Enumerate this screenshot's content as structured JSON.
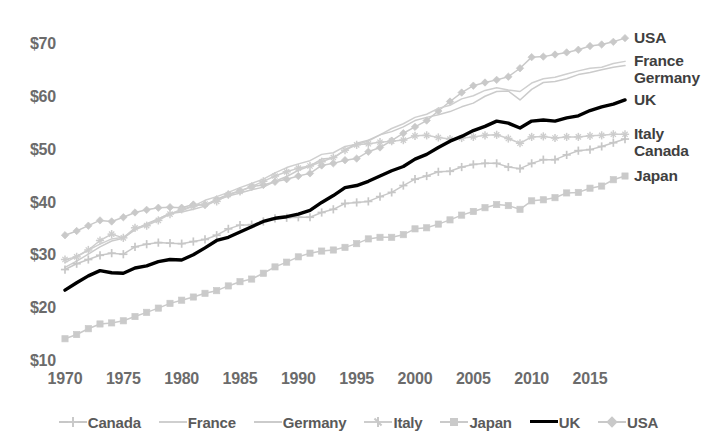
{
  "chart_data": {
    "type": "line",
    "title": "",
    "subtitle": "",
    "xlabel": "",
    "ylabel": "",
    "xlim": [
      1970,
      2019
    ],
    "ylim": [
      10,
      72
    ],
    "grid": false,
    "legend_position": "bottom",
    "y_tick_labels": [
      "$70",
      "$60",
      "$50",
      "$40",
      "$30",
      "$20",
      "$10"
    ],
    "y_tick_values": [
      70,
      60,
      50,
      40,
      30,
      20,
      10
    ],
    "x_tick_labels": [
      "1970",
      "1975",
      "1980",
      "1985",
      "1990",
      "1995",
      "2000",
      "2005",
      "2010",
      "2015"
    ],
    "x_tick_values": [
      1970,
      1975,
      1980,
      1985,
      1990,
      1995,
      2000,
      2005,
      2010,
      2015
    ],
    "x": [
      1970,
      1971,
      1972,
      1973,
      1974,
      1975,
      1976,
      1977,
      1978,
      1979,
      1980,
      1981,
      1982,
      1983,
      1984,
      1985,
      1986,
      1987,
      1988,
      1989,
      1990,
      1991,
      1992,
      1993,
      1994,
      1995,
      1996,
      1997,
      1998,
      1999,
      2000,
      2001,
      2002,
      2003,
      2004,
      2005,
      2006,
      2007,
      2008,
      2009,
      2010,
      2011,
      2012,
      2013,
      2014,
      2015,
      2016,
      2017,
      2018
    ],
    "series": [
      {
        "name": "USA",
        "color": "#c9c9c9",
        "marker": "diamond",
        "emphasis": false,
        "end_label": "USA",
        "values": [
          34.0,
          34.8,
          35.8,
          36.8,
          36.6,
          37.4,
          38.3,
          38.8,
          39.2,
          39.3,
          39.2,
          39.8,
          39.7,
          40.8,
          41.7,
          42.4,
          43.2,
          43.5,
          44.1,
          44.6,
          45.2,
          45.7,
          47.2,
          47.6,
          48.2,
          48.5,
          49.8,
          50.6,
          51.9,
          53.3,
          54.5,
          55.7,
          57.5,
          59.3,
          61.0,
          62.3,
          62.9,
          63.4,
          64.0,
          65.6,
          67.7,
          67.8,
          68.2,
          68.6,
          69.1,
          69.8,
          70.1,
          70.6,
          71.3
        ]
      },
      {
        "name": "France",
        "color": "#cfcfcf",
        "marker": "none",
        "emphasis": false,
        "end_label": "France",
        "values": [
          28.8,
          30.0,
          31.2,
          32.3,
          33.3,
          33.6,
          35.0,
          35.9,
          37.1,
          38.1,
          38.6,
          39.5,
          40.6,
          41.3,
          42.1,
          43.0,
          43.8,
          44.6,
          45.8,
          46.8,
          47.5,
          48.1,
          49.3,
          49.6,
          50.8,
          51.2,
          51.8,
          53.0,
          54.2,
          55.1,
          56.3,
          56.9,
          58.0,
          58.6,
          59.8,
          60.4,
          61.4,
          61.9,
          61.5,
          61.2,
          62.8,
          63.6,
          63.9,
          64.5,
          65.1,
          65.6,
          65.8,
          66.5,
          66.9
        ]
      },
      {
        "name": "Germany",
        "color": "#cbcbcb",
        "marker": "none",
        "emphasis": false,
        "end_label": "Germany",
        "values": [
          27.9,
          29.1,
          30.4,
          31.8,
          32.9,
          33.4,
          35.1,
          36.2,
          37.1,
          38.1,
          38.4,
          38.9,
          39.5,
          40.6,
          41.4,
          42.0,
          42.6,
          43.1,
          44.2,
          45.1,
          46.3,
          47.1,
          48.4,
          48.6,
          50.1,
          51.4,
          52.0,
          53.0,
          53.6,
          54.5,
          55.7,
          56.3,
          56.8,
          57.4,
          58.3,
          59.0,
          60.3,
          61.2,
          61.3,
          59.6,
          61.6,
          62.9,
          63.1,
          63.6,
          64.4,
          64.8,
          65.3,
          65.8,
          66.1
        ]
      },
      {
        "name": "UK",
        "color": "#000000",
        "marker": "none",
        "emphasis": true,
        "end_label": "UK",
        "values": [
          23.6,
          25.0,
          26.3,
          27.3,
          26.9,
          26.8,
          27.8,
          28.2,
          29.0,
          29.4,
          29.3,
          30.3,
          31.6,
          33.0,
          33.6,
          34.6,
          35.6,
          36.6,
          37.2,
          37.5,
          38.0,
          38.7,
          40.2,
          41.5,
          43.0,
          43.4,
          44.2,
          45.2,
          46.2,
          47.0,
          48.4,
          49.3,
          50.6,
          51.8,
          52.7,
          53.8,
          54.6,
          55.6,
          55.2,
          54.3,
          55.6,
          55.8,
          55.6,
          56.2,
          56.6,
          57.6,
          58.3,
          58.8,
          59.6
        ]
      },
      {
        "name": "Italy",
        "color": "#cdcdcd",
        "marker": "star",
        "emphasis": false,
        "end_label": "Italy",
        "values": [
          29.4,
          29.9,
          31.2,
          33.0,
          34.2,
          33.5,
          35.4,
          35.8,
          36.8,
          38.0,
          38.9,
          39.5,
          39.9,
          40.4,
          41.7,
          42.3,
          43.2,
          44.2,
          45.2,
          46.0,
          46.7,
          47.1,
          47.9,
          48.7,
          50.1,
          51.1,
          51.3,
          51.6,
          51.8,
          52.0,
          52.8,
          52.9,
          52.5,
          52.2,
          52.4,
          52.6,
          52.9,
          53.0,
          52.3,
          51.4,
          52.6,
          52.7,
          52.4,
          52.6,
          52.6,
          52.8,
          52.9,
          53.1,
          53.1
        ]
      },
      {
        "name": "Canada",
        "color": "#c7c7c7",
        "marker": "plus",
        "emphasis": false,
        "end_label": "Canada",
        "values": [
          27.5,
          28.6,
          29.4,
          30.2,
          30.6,
          30.4,
          31.8,
          32.3,
          32.6,
          32.5,
          32.4,
          32.8,
          33.2,
          34.0,
          35.2,
          35.9,
          36.0,
          36.6,
          37.2,
          37.3,
          37.4,
          37.4,
          38.3,
          38.9,
          40.0,
          40.2,
          40.4,
          41.3,
          42.1,
          43.4,
          44.6,
          45.2,
          46.0,
          46.1,
          46.9,
          47.4,
          47.6,
          47.6,
          46.9,
          46.6,
          47.6,
          48.3,
          48.3,
          49.2,
          50.0,
          50.2,
          50.8,
          51.5,
          52.2
        ]
      },
      {
        "name": "Japan",
        "color": "#cacaca",
        "marker": "square",
        "emphasis": false,
        "end_label": "Japan",
        "values": [
          14.4,
          15.2,
          16.3,
          17.2,
          17.4,
          17.8,
          18.6,
          19.4,
          20.2,
          21.1,
          21.7,
          22.3,
          23.0,
          23.5,
          24.4,
          25.2,
          25.7,
          26.8,
          28.0,
          28.9,
          29.9,
          30.6,
          31.0,
          31.2,
          31.7,
          32.4,
          33.3,
          33.6,
          33.6,
          34.1,
          35.2,
          35.4,
          36.1,
          36.9,
          37.8,
          38.5,
          39.2,
          39.8,
          39.6,
          38.9,
          40.5,
          40.7,
          41.1,
          42.0,
          42.1,
          42.9,
          43.3,
          44.5,
          45.2
        ]
      }
    ]
  },
  "legend": {
    "items": [
      {
        "label": "Canada",
        "marker": "plus",
        "color": "#c7c7c7",
        "bold": false
      },
      {
        "label": "France",
        "marker": "none",
        "color": "#cfcfcf",
        "bold": false
      },
      {
        "label": "Germany",
        "marker": "none",
        "color": "#cbcbcb",
        "bold": false
      },
      {
        "label": "Italy",
        "marker": "star",
        "color": "#cdcdcd",
        "bold": false
      },
      {
        "label": "Japan",
        "marker": "square",
        "color": "#cacaca",
        "bold": false
      },
      {
        "label": "UK",
        "marker": "none",
        "color": "#000000",
        "bold": true
      },
      {
        "label": "USA",
        "marker": "diamond",
        "color": "#c9c9c9",
        "bold": false
      }
    ]
  },
  "colors": {
    "background": "#ffffff",
    "grey_series": "#c9c9c9",
    "emphasis_series": "#000000",
    "tick_text": "#6b6b6b",
    "label_text": "#3f3f3f"
  }
}
